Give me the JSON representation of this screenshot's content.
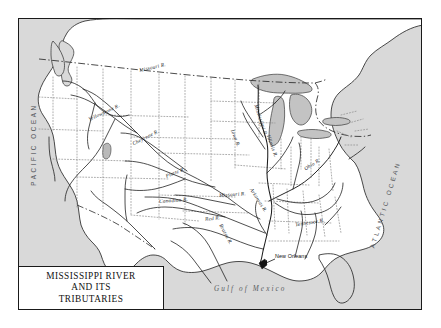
{
  "map": {
    "title_lines": [
      "MISSISSIPPI RIVER",
      "AND ITS",
      "TRIBUTARIES"
    ],
    "colors": {
      "water": "#d9d9d9",
      "land": "#ffffff",
      "lakes": "#c3c3c3",
      "coastline": "#2b2b2b",
      "river": "#1c1c1c",
      "state_border": "#8a8a8a",
      "national_border": "#2b2b2b",
      "frame": "#1a1a1a",
      "label_text": "#15191e",
      "ocean_text": "#4d5055"
    },
    "oceans": [
      {
        "name": "PACIFIC OCEAN",
        "orientation": "vertical-left"
      },
      {
        "name": "ATLANTIC OCEAN",
        "orientation": "diagonal-right"
      }
    ],
    "seas": [
      {
        "name": "Gulf of Mexico"
      }
    ],
    "cities": [
      {
        "name": "New Orleans",
        "marker": "arrow-pointer"
      }
    ],
    "rivers": [
      {
        "name": "Missouri R.",
        "rotate": -13
      },
      {
        "name": "Yellowstone R.",
        "rotate": -25
      },
      {
        "name": "Cheyenne R.",
        "rotate": -27
      },
      {
        "name": "Platte R.",
        "rotate": -22
      },
      {
        "name": "Canadian R.",
        "rotate": -4
      },
      {
        "name": "Arkansas R.",
        "rotate": 57
      },
      {
        "name": "Red R.",
        "rotate": -6
      },
      {
        "name": "Brazos R.",
        "rotate": 62
      },
      {
        "name": "Mississippi R.",
        "rotate": 72
      },
      {
        "name": "Iowa R.",
        "rotate": 68
      },
      {
        "name": "Missouri R.",
        "rotate": -4
      },
      {
        "name": "Illinois R.",
        "rotate": 70
      },
      {
        "name": "Ohio R.",
        "rotate": -32
      },
      {
        "name": "Tennessee R.",
        "rotate": -9
      }
    ],
    "legend": {
      "national_border_style": "dash-dot",
      "state_border_style": "dotted"
    }
  }
}
